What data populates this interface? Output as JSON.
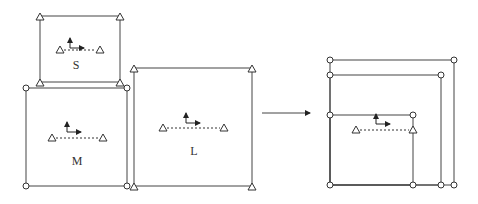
{
  "diagram": {
    "colors": {
      "stroke": "#444444",
      "marker": "#333333",
      "background": "#ffffff"
    },
    "panels": {
      "left": {
        "boxes": [
          {
            "id": "S",
            "label": "S",
            "x1": 40,
            "y1": 16,
            "x2": 120,
            "y2": 82,
            "marker": "triangle",
            "axes_origin": [
              70,
              43
            ],
            "dash": [
              60,
              50,
              100
            ],
            "label_pos": [
              76,
              69
            ]
          },
          {
            "id": "M",
            "label": "M",
            "x1": 26,
            "y1": 88,
            "x2": 127,
            "y2": 186,
            "marker": "circle",
            "axes_origin": [
              67,
              127
            ],
            "dash": [
              52,
              138,
              103
            ],
            "label_pos": [
              77,
              165
            ]
          },
          {
            "id": "L",
            "label": "L",
            "x1": 134,
            "y1": 68,
            "x2": 252,
            "y2": 186,
            "marker": "triangle",
            "axes_origin": [
              186,
              118
            ],
            "dash": [
              163,
              128,
              224
            ],
            "label_pos": [
              194,
              155
            ]
          }
        ]
      },
      "transition_arrow": {
        "x1": 262,
        "y1": 113,
        "x2": 310,
        "y2": 113
      },
      "right": {
        "left_x": 330,
        "bottom_y": 185,
        "nested": [
          {
            "top_y": 60,
            "right_x": 454
          },
          {
            "top_y": 75,
            "right_x": 441
          },
          {
            "top_y": 115,
            "right_x": 413
          }
        ],
        "axes_origin": [
          376,
          119
        ],
        "dash": [
          356,
          130,
          413
        ]
      }
    }
  }
}
